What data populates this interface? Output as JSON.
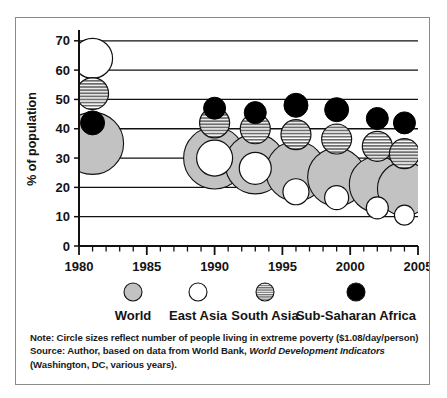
{
  "figure": {
    "y_axis_title": "% of population",
    "note_line1_prefix": "Note: Circle sizes reflect number of people living in extreme poverty ($1.08/day/person)",
    "note_line2_prefix": "Source: Author, based on data from World Bank, ",
    "note_line2_italic": "World Development Indicators",
    "note_line3": "(Washington, DC, various years)."
  },
  "chart_data": {
    "type": "scatter",
    "title": "",
    "xlabel": "",
    "ylabel": "% of population",
    "xlim": [
      1980,
      2005
    ],
    "ylim": [
      0,
      73
    ],
    "grid": true,
    "gridlines_y": [
      10,
      20,
      30,
      40,
      50,
      60,
      70
    ],
    "y_ticks": [
      0,
      10,
      20,
      30,
      40,
      50,
      60,
      70
    ],
    "y_tick_labels": [
      "0",
      "10",
      "20",
      "30",
      "40",
      "50",
      "60",
      "70"
    ],
    "x_ticks": [
      1980,
      1981,
      1982,
      1983,
      1984,
      1985,
      1986,
      1987,
      1988,
      1989,
      1990,
      1991,
      1992,
      1993,
      1994,
      1995,
      1996,
      1997,
      1998,
      1999,
      2000,
      2001,
      2002,
      2003,
      2004,
      2005
    ],
    "x_tick_labels_major": [
      "1980",
      "1985",
      "1990",
      "1995",
      "2000",
      "2005"
    ],
    "x_ticks_major": [
      1980,
      1985,
      1990,
      1995,
      2000,
      2005
    ],
    "size_meaning": "Circle sizes reflect number of people living in extreme poverty",
    "legend_position": "bottom",
    "series": [
      {
        "name": "World",
        "style": "gray-fill",
        "color": "#bcbcbc",
        "points": [
          {
            "x": 1981,
            "y": 35.0,
            "r": 31
          },
          {
            "x": 1990,
            "y": 30.0,
            "r": 31
          },
          {
            "x": 1993,
            "y": 28.0,
            "r": 30
          },
          {
            "x": 1996,
            "y": 25.5,
            "r": 30
          },
          {
            "x": 1999,
            "y": 23.5,
            "r": 29
          },
          {
            "x": 2002,
            "y": 21.0,
            "r": 28
          },
          {
            "x": 2004,
            "y": 19.5,
            "r": 27
          }
        ]
      },
      {
        "name": "East Asia",
        "style": "white-fill",
        "color": "#ffffff",
        "points": [
          {
            "x": 1981,
            "y": 64.0,
            "r": 20
          },
          {
            "x": 1990,
            "y": 30.0,
            "r": 18
          },
          {
            "x": 1993,
            "y": 26.5,
            "r": 16
          },
          {
            "x": 1996,
            "y": 18.5,
            "r": 13
          },
          {
            "x": 1999,
            "y": 16.5,
            "r": 12
          },
          {
            "x": 2002,
            "y": 13.0,
            "r": 11
          },
          {
            "x": 2004,
            "y": 10.5,
            "r": 10
          }
        ]
      },
      {
        "name": "South Asia",
        "style": "hatch-horizontal",
        "color": "#8f8f8f",
        "points": [
          {
            "x": 1981,
            "y": 52.0,
            "r": 16
          },
          {
            "x": 1990,
            "y": 42.0,
            "r": 15
          },
          {
            "x": 1993,
            "y": 40.0,
            "r": 15
          },
          {
            "x": 1996,
            "y": 38.0,
            "r": 15
          },
          {
            "x": 1999,
            "y": 36.5,
            "r": 15
          },
          {
            "x": 2002,
            "y": 34.0,
            "r": 15
          },
          {
            "x": 2004,
            "y": 31.5,
            "r": 15
          }
        ]
      },
      {
        "name": "Sub-Saharan Africa",
        "style": "black-fill",
        "color": "#000000",
        "points": [
          {
            "x": 1981,
            "y": 42.0,
            "r": 12
          },
          {
            "x": 1990,
            "y": 47.0,
            "r": 11
          },
          {
            "x": 1993,
            "y": 45.5,
            "r": 11
          },
          {
            "x": 1996,
            "y": 48.0,
            "r": 12
          },
          {
            "x": 1999,
            "y": 46.5,
            "r": 12
          },
          {
            "x": 2002,
            "y": 43.5,
            "r": 11
          },
          {
            "x": 2004,
            "y": 42.0,
            "r": 11
          }
        ]
      }
    ],
    "legend": [
      {
        "label": "World",
        "style": "gray-fill"
      },
      {
        "label": "East Asia",
        "style": "white-fill"
      },
      {
        "label": "South Asia",
        "style": "hatch-horizontal"
      },
      {
        "label": "Sub-Saharan Africa",
        "style": "black-fill"
      }
    ]
  }
}
